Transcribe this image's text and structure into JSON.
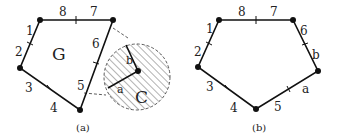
{
  "panels": [
    {
      "caption": "(a)",
      "region_label": "G",
      "circle_label": "C",
      "edge_labels": [
        "1",
        "2",
        "3",
        "4",
        "5",
        "6",
        "7",
        "8"
      ],
      "inner_labels": [
        "a",
        "b"
      ]
    },
    {
      "caption": "(b)",
      "edge_labels": [
        "1",
        "2",
        "3",
        "4",
        "5",
        "6",
        "7",
        "8",
        "a",
        "b"
      ]
    }
  ],
  "colors": {
    "stroke": "#111111",
    "text": "#222222",
    "hatch": "#555555"
  }
}
